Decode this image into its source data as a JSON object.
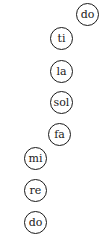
{
  "diagram": {
    "notes": [
      {
        "label": "do",
        "x": 88,
        "y": 14
      },
      {
        "label": "ti",
        "x": 62,
        "y": 38
      },
      {
        "label": "la",
        "x": 62,
        "y": 71
      },
      {
        "label": "sol",
        "x": 62,
        "y": 102
      },
      {
        "label": "fa",
        "x": 60,
        "y": 134
      },
      {
        "label": "mi",
        "x": 36,
        "y": 158
      },
      {
        "label": "re",
        "x": 36,
        "y": 190
      },
      {
        "label": "do",
        "x": 36,
        "y": 222
      }
    ]
  }
}
